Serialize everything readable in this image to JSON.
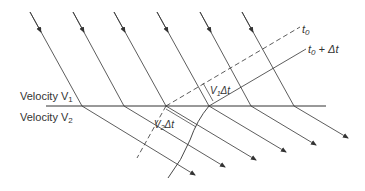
{
  "labels": {
    "velocity_v1": "Velocity V",
    "velocity_v1_sub": "1",
    "velocity_v2": "Velocity V",
    "velocity_v2_sub": "2",
    "t0": "t",
    "t0_sub": "0",
    "t0_dt": "t",
    "t0_dt_sub": "0",
    "t0_dt_suffix": " + Δt",
    "v1dt": "V",
    "v1dt_sub": "1",
    "v1dt_suffix": "Δt",
    "v2dt": "V",
    "v2dt_sub": "2",
    "v2dt_suffix": "Δt"
  },
  "colors": {
    "line": "#333333"
  }
}
